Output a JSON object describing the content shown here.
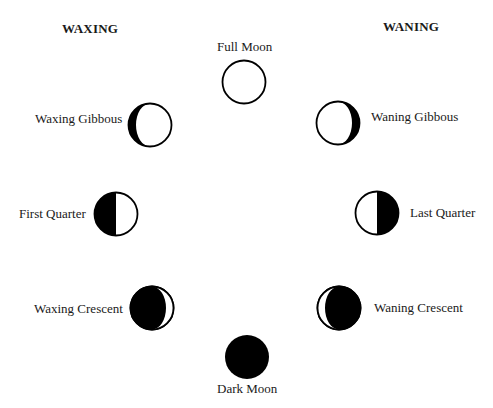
{
  "headers": {
    "waxing": "WAXING",
    "waning": "WANING"
  },
  "phases": [
    {
      "id": "full-moon",
      "label": "Full Moon"
    },
    {
      "id": "waxing-gibbous",
      "label": "Waxing Gibbous"
    },
    {
      "id": "first-quarter",
      "label": "First Quarter"
    },
    {
      "id": "waxing-crescent",
      "label": "Waxing Crescent"
    },
    {
      "id": "dark-moon",
      "label": "Dark Moon"
    },
    {
      "id": "waning-crescent",
      "label": "Waning Crescent"
    },
    {
      "id": "last-quarter",
      "label": "Last Quarter"
    },
    {
      "id": "waning-gibbous",
      "label": "Waning Gibbous"
    }
  ],
  "colors": {
    "dark": "#000000",
    "light": "#ffffff",
    "text": "#1a1a1a"
  }
}
